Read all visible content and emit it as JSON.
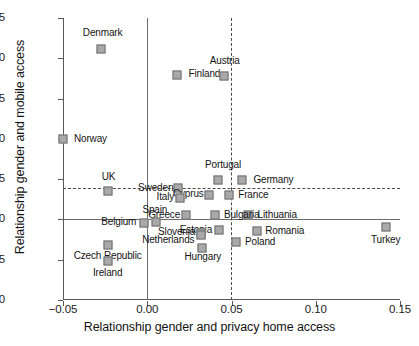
{
  "chart_data": {
    "type": "scatter",
    "title": "",
    "xlabel": "Relationship gender and privacy home access",
    "ylabel": "Relationship gender and mobile access",
    "xlim": [
      -0.05,
      0.15
    ],
    "ylim": [
      -0.1,
      0.25
    ],
    "xticks": [
      -0.05,
      0.0,
      0.05,
      0.1,
      0.15
    ],
    "xtick_labels": [
      "−0.05",
      "0.00",
      "0.05",
      "0.10",
      "0.15"
    ],
    "yticks": [
      0.25,
      0.2,
      0.15,
      0.1,
      0.05,
      0.0,
      -0.05,
      -0.1
    ],
    "ytick_labels": [
      "0.25",
      "0.20",
      "0.15",
      "0.10",
      "0.05",
      "−0.00",
      "−0.05",
      "−0.10"
    ],
    "grid": false,
    "legend": "none",
    "reference_lines": [
      {
        "name": "zero-vertical",
        "axis": "x",
        "value": 0.0,
        "style": "solid"
      },
      {
        "name": "zero-horizontal",
        "axis": "y",
        "value": 0.0,
        "style": "solid"
      },
      {
        "name": "mean-vertical",
        "axis": "x",
        "value": 0.0497,
        "style": "dashed"
      },
      {
        "name": "mean-horizontal",
        "axis": "y",
        "value": 0.0385,
        "style": "dashed"
      }
    ],
    "points": [
      {
        "label": "Denmark",
        "x": -0.0275,
        "y": 0.2115,
        "lx": -0.0265,
        "ly": 0.2315,
        "anchor": "center"
      },
      {
        "label": "Finland",
        "x": 0.0175,
        "y": 0.1795,
        "lx": 0.0245,
        "ly": 0.181,
        "anchor": "left"
      },
      {
        "label": "Austria",
        "x": 0.0455,
        "y": 0.178,
        "lx": 0.046,
        "ly": 0.1965,
        "anchor": "center"
      },
      {
        "label": "Norway",
        "x": -0.05,
        "y": 0.0995,
        "lx": -0.0435,
        "ly": 0.1,
        "anchor": "left"
      },
      {
        "label": "Portugal",
        "x": 0.042,
        "y": 0.049,
        "lx": 0.045,
        "ly": 0.067,
        "anchor": "center"
      },
      {
        "label": "Germany",
        "x": 0.0565,
        "y": 0.0485,
        "lx": 0.063,
        "ly": 0.0495,
        "anchor": "left"
      },
      {
        "label": "UK",
        "x": -0.0235,
        "y": 0.0355,
        "lx": -0.023,
        "ly": 0.053,
        "anchor": "center"
      },
      {
        "label": "Sweden",
        "x": 0.0185,
        "y": 0.0385,
        "lx": 0.0155,
        "ly": 0.0395,
        "anchor": "right"
      },
      {
        "label": "Cyprus",
        "x": 0.0365,
        "y": 0.03,
        "lx": 0.0335,
        "ly": 0.031,
        "anchor": "right"
      },
      {
        "label": "France",
        "x": 0.0485,
        "y": 0.03,
        "lx": 0.054,
        "ly": 0.0305,
        "anchor": "left"
      },
      {
        "label": "Italy",
        "x": 0.0195,
        "y": 0.027,
        "lx": 0.016,
        "ly": 0.028,
        "anchor": "right"
      },
      {
        "label": "Lithuania",
        "x": 0.06,
        "y": 0.0055,
        "lx": 0.0655,
        "ly": 0.006,
        "anchor": "left"
      },
      {
        "label": "Bulgaria",
        "x": 0.04,
        "y": 0.0055,
        "lx": 0.0455,
        "ly": 0.006,
        "anchor": "left"
      },
      {
        "label": "Greece",
        "x": 0.023,
        "y": 0.005,
        "lx": 0.0195,
        "ly": 0.006,
        "anchor": "right"
      },
      {
        "label": "Spain",
        "x": 0.005,
        "y": -0.0035,
        "lx": 0.0045,
        "ly": 0.0115,
        "anchor": "center"
      },
      {
        "label": "Belgium",
        "x": -0.002,
        "y": -0.004,
        "lx": -0.0065,
        "ly": -0.0035,
        "anchor": "right"
      },
      {
        "label": "Estonia",
        "x": 0.0425,
        "y": -0.013,
        "lx": 0.0385,
        "ly": -0.0125,
        "anchor": "right"
      },
      {
        "label": "Romania",
        "x": 0.065,
        "y": -0.0145,
        "lx": 0.07,
        "ly": -0.014,
        "anchor": "left"
      },
      {
        "label": "Slovenia",
        "x": 0.032,
        "y": -0.0165,
        "lx": 0.0285,
        "ly": -0.0155,
        "anchor": "right"
      },
      {
        "label": "Netherlands",
        "x": 0.032,
        "y": -0.019,
        "lx": 0.028,
        "ly": -0.0255,
        "anchor": "right"
      },
      {
        "label": "Turkey",
        "x": 0.1415,
        "y": -0.0095,
        "lx": 0.1415,
        "ly": -0.026,
        "anchor": "center"
      },
      {
        "label": "Poland",
        "x": 0.0525,
        "y": -0.028,
        "lx": 0.058,
        "ly": -0.0275,
        "anchor": "left"
      },
      {
        "label": "Hungary",
        "x": 0.0325,
        "y": -0.035,
        "lx": 0.033,
        "ly": -0.047,
        "anchor": "center"
      },
      {
        "label": "Czech Republic",
        "x": -0.023,
        "y": -0.032,
        "lx": -0.0235,
        "ly": -0.046,
        "anchor": "center"
      },
      {
        "label": "Ireland",
        "x": -0.023,
        "y": -0.052,
        "lx": -0.0235,
        "ly": -0.066,
        "anchor": "center"
      }
    ]
  }
}
